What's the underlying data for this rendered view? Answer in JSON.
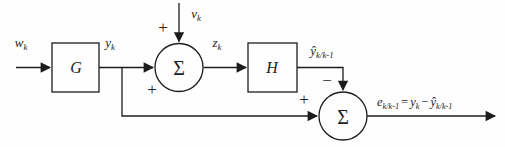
{
  "diagram": {
    "background": "#fefefe",
    "line_color": "#1c1c1c",
    "blocks": {
      "g": {
        "label": "G"
      },
      "h": {
        "label": "H"
      }
    },
    "summing_junctions": {
      "sum1": {
        "symbol": "Σ",
        "sign_top": "+",
        "sign_left": "+"
      },
      "sum2": {
        "symbol": "Σ",
        "sign_top": "−",
        "sign_left": "+"
      }
    },
    "signals": {
      "w": {
        "base": "w",
        "sub": "k"
      },
      "y": {
        "base": "y",
        "sub": "k"
      },
      "v": {
        "base": "v",
        "sub": "k"
      },
      "z": {
        "base": "z",
        "sub": "k"
      },
      "yhat": {
        "base": "ŷ",
        "sub": "k/k-1"
      }
    },
    "output_equation": {
      "lhs_base": "e",
      "lhs_sub": "k/k-1",
      "equals": "=",
      "term1_base": "y",
      "term1_sub": "k",
      "minus": "−",
      "term2_base": "ŷ",
      "term2_sub": "k/k-1"
    }
  }
}
